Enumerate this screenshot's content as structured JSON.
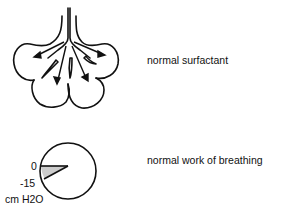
{
  "rows": [
    {
      "caption": "normal surfactant"
    },
    {
      "caption": "normal work of breathing"
    }
  ],
  "pressure_gauge": {
    "tick_top": "0",
    "tick_bottom": "-15",
    "unit": "cm H2O"
  },
  "colors": {
    "stroke": "#111111",
    "wedge_fill": "#cccccc",
    "background": "#ffffff"
  }
}
